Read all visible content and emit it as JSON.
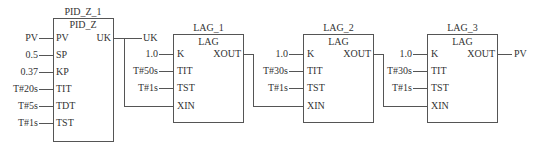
{
  "blocks": [
    {
      "instance": "PID_Z_1",
      "type": "PID_Z",
      "inputs": [
        {
          "pin": "PV",
          "value": "PV"
        },
        {
          "pin": "SP",
          "value": "0.5"
        },
        {
          "pin": "KP",
          "value": "0.37"
        },
        {
          "pin": "TIT",
          "value": "T#20s"
        },
        {
          "pin": "TDT",
          "value": "T#5s"
        },
        {
          "pin": "TST",
          "value": "T#1s"
        }
      ],
      "outputs": [
        {
          "pin": "UK",
          "value": "UK"
        }
      ]
    },
    {
      "instance": "LAG_1",
      "type": "LAG",
      "inputs": [
        {
          "pin": "K",
          "value": "1.0"
        },
        {
          "pin": "TIT",
          "value": "T#50s"
        },
        {
          "pin": "TST",
          "value": "T#1s"
        },
        {
          "pin": "XIN",
          "value": ""
        }
      ],
      "outputs": [
        {
          "pin": "XOUT",
          "value": ""
        }
      ]
    },
    {
      "instance": "LAG_2",
      "type": "LAG",
      "inputs": [
        {
          "pin": "K",
          "value": "1.0"
        },
        {
          "pin": "TIT",
          "value": "T#30s"
        },
        {
          "pin": "TST",
          "value": "T#1s"
        },
        {
          "pin": "XIN",
          "value": ""
        }
      ],
      "outputs": [
        {
          "pin": "XOUT",
          "value": ""
        }
      ]
    },
    {
      "instance": "LAG_3",
      "type": "LAG",
      "inputs": [
        {
          "pin": "K",
          "value": "1.0"
        },
        {
          "pin": "TIT",
          "value": "T#30s"
        },
        {
          "pin": "TST",
          "value": "T#1s"
        },
        {
          "pin": "XIN",
          "value": ""
        }
      ],
      "outputs": [
        {
          "pin": "XOUT",
          "value": "PV"
        }
      ]
    }
  ],
  "connections": [
    {
      "from": "PID_Z_1.UK",
      "to": "LAG_1.XIN"
    },
    {
      "from": "LAG_1.XOUT",
      "to": "LAG_2.XIN"
    },
    {
      "from": "LAG_2.XOUT",
      "to": "LAG_3.XIN"
    }
  ]
}
